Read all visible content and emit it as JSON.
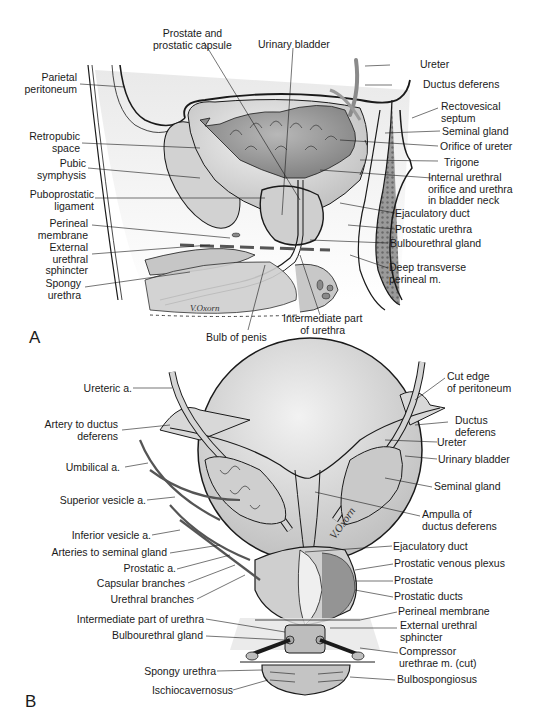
{
  "figure": {
    "panels": [
      {
        "id": "A",
        "letter": "A",
        "view": "sagittal section of male pelvis",
        "signature": "V.Oxorn",
        "labels_left": [
          "Parietal\nperitoneum",
          "Retropubic\nspace",
          "Pubic\nsymphysis",
          "Puboprostatic\nligament",
          "Perineal\nmembrane",
          "External\nurethral\nsphincter",
          "Spongy\nurethra"
        ],
        "labels_top": [
          "Prostate and\nprostatic capsule",
          "Urinary bladder"
        ],
        "labels_right": [
          "Ureter",
          "Ductus deferens",
          "Rectovesical\nseptum",
          "Seminal gland",
          "Orifice of ureter",
          "Trigone",
          "Internal urethral\norifice and urethra\nin bladder neck",
          "Ejaculatory duct",
          "Prostatic urethra",
          "Bulbourethral gland",
          "Deep transverse\nperineal m."
        ],
        "labels_bottom": [
          "Bulb of penis",
          "Intermediate part\nof urethra"
        ]
      },
      {
        "id": "B",
        "letter": "B",
        "view": "posterior view of bladder and prostate",
        "signature": "V.Oxorn",
        "labels_left": [
          "Ureteric a.",
          "Artery to ductus\ndeferens",
          "Umbilical a.",
          "Superior vesicle a.",
          "Inferior vesicle a.",
          "Arteries to seminal gland",
          "Prostatic a.",
          "Capsular branches",
          "Urethral branches",
          "Intermediate part of urethra",
          "Bulbourethral gland",
          "Spongy urethra",
          "Ischiocavernosus"
        ],
        "labels_right": [
          "Cut edge\nof peritoneum",
          "Ductus\ndeferens",
          "Ureter",
          "Urinary bladder",
          "Seminal gland",
          "Ampulla of\nductus deferens",
          "Ejaculatory duct",
          "Prostatic venous plexus",
          "Prostate",
          "Prostatic ducts",
          "Perineal membrane",
          "External urethral\nsphincter",
          "Compressor\nurethrae m. (cut)",
          "Bulbospongiosus"
        ]
      }
    ]
  },
  "colors": {
    "ink": "#1a1a1a",
    "tissue_light": "#e4e4e4",
    "tissue_mid": "#c4c4c4",
    "tissue_dark": "#8a8a8a",
    "bladder_wall": "#d6d6d6",
    "bladder_mucosa": "#9a9a9a",
    "background": "#ffffff"
  }
}
